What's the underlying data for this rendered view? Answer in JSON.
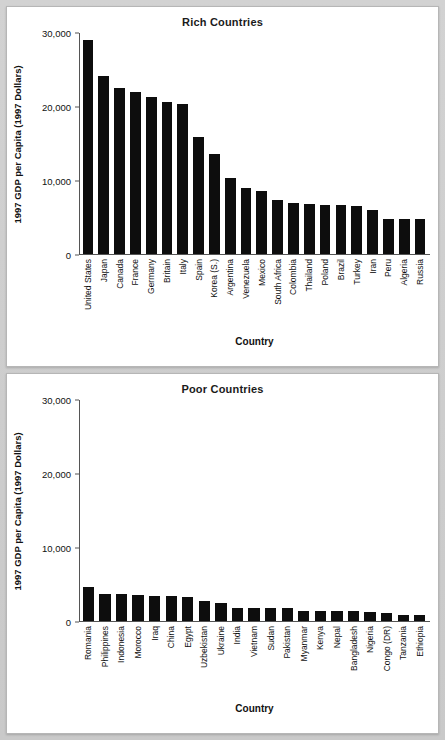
{
  "page": {
    "background_color": "#cfcfcf",
    "panel_background": "#ffffff",
    "bar_color": "#0d0d0d"
  },
  "chart_data": [
    {
      "type": "bar",
      "title": "Rich Countries",
      "xlabel": "Country",
      "ylabel": "1997 GDP per Capita (1997 Dollars)",
      "ylim": [
        0,
        30000
      ],
      "yticks": [
        0,
        10000,
        20000,
        30000
      ],
      "ytick_labels": [
        "0",
        "10,000",
        "20,000",
        "30,000"
      ],
      "grid": false,
      "legend": "none",
      "categories": [
        "United States",
        "Japan",
        "Canada",
        "France",
        "Germany",
        "Britain",
        "Italy",
        "Spain",
        "Korea (S.)",
        "Argentina",
        "Venezuela",
        "Mexico",
        "South Africa",
        "Colombia",
        "Thailand",
        "Poland",
        "Brazil",
        "Turkey",
        "Iran",
        "Peru",
        "Algeria",
        "Russia"
      ],
      "values": [
        29000,
        24100,
        22500,
        22000,
        21300,
        20700,
        20300,
        15900,
        13600,
        10300,
        9000,
        8500,
        7400,
        6900,
        6800,
        6700,
        6600,
        6500,
        6000,
        4800,
        4750,
        4700
      ]
    },
    {
      "type": "bar",
      "title": "Poor Countries",
      "xlabel": "Country",
      "ylabel": "1997 GDP per Capita (1997 Dollars)",
      "ylim": [
        0,
        30000
      ],
      "yticks": [
        0,
        10000,
        20000,
        30000
      ],
      "ytick_labels": [
        "0",
        "10,000",
        "20,000",
        "30,000"
      ],
      "grid": false,
      "legend": "none",
      "categories": [
        "Romania",
        "Philippines",
        "Indonesia",
        "Morocco",
        "Iraq",
        "China",
        "Egypt",
        "Uzbekistan",
        "Ukraine",
        "India",
        "Vietnam",
        "Sudan",
        "Pakistan",
        "Myanmar",
        "Kenya",
        "Nepal",
        "Bangladesh",
        "Nigeria",
        "Congo (DR)",
        "Tanzania",
        "Ethiopia"
      ],
      "values": [
        4600,
        3700,
        3650,
        3500,
        3400,
        3350,
        3300,
        2750,
        2400,
        1800,
        1780,
        1750,
        1740,
        1400,
        1380,
        1350,
        1300,
        1200,
        1150,
        800,
        750
      ]
    }
  ]
}
